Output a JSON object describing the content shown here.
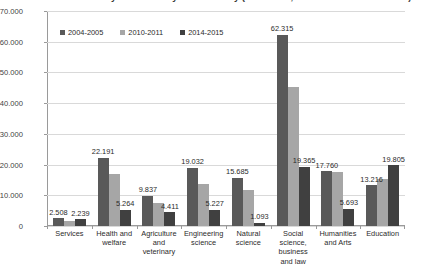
{
  "chart_data": {
    "type": "bar",
    "title": "Graduates from tertiary education by field of study (2004-2005, 2010-2011 and 2014-2015)",
    "xlabel": "",
    "ylabel": "",
    "ylim": [
      0,
      70000
    ],
    "ytick_labels": [
      "70.000",
      "60.000",
      "50.000",
      "40.000",
      "30.000",
      "20.000",
      "10.000",
      "0"
    ],
    "ytick_values": [
      70000,
      60000,
      50000,
      40000,
      30000,
      20000,
      10000,
      0
    ],
    "grid": true,
    "legend_position": "top-left",
    "categories": [
      "Services",
      "Health and welfare",
      "Agriculture and veterinary",
      "Engineering science",
      "Natural science",
      "Social science, business and law",
      "Humanities and Arts",
      "Education"
    ],
    "series": [
      {
        "name": "2004-2005",
        "color": "#595959",
        "values": [
          2508,
          22191,
          9837,
          19032,
          15685,
          62315,
          17760,
          13216
        ],
        "labels": [
          "2.508",
          "22.191",
          "9.837",
          "19.032",
          "15.685",
          "62.315",
          "17.760",
          "13.216"
        ]
      },
      {
        "name": "2010-2011",
        "color": "#a6a6a6",
        "values": [
          1750,
          16900,
          7600,
          13600,
          11800,
          45200,
          17600,
          15300
        ],
        "labels": [
          "",
          "",
          "",
          "",
          "",
          "",
          "",
          ""
        ]
      },
      {
        "name": "2014-2015",
        "color": "#404040",
        "values": [
          2239,
          5264,
          4411,
          5227,
          1093,
          19365,
          5693,
          19805
        ],
        "labels": [
          "2.239",
          "5.264",
          "4.411",
          "5.227",
          "1.093",
          "19.365",
          "5.693",
          "19.805"
        ]
      }
    ]
  }
}
